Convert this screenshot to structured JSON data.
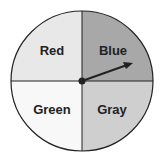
{
  "spinner": {
    "sections": [
      {
        "label": "Red",
        "position": "top-left",
        "fill": "#e8e8e8"
      },
      {
        "label": "Blue",
        "position": "top-right",
        "fill": "#a8a8a8"
      },
      {
        "label": "Green",
        "position": "bottom-left",
        "fill": "#f8f8f8"
      },
      {
        "label": "Gray",
        "position": "bottom-right",
        "fill": "#cfcfcf"
      }
    ],
    "outline_color": "#222222",
    "arrow": {
      "pointing_section": "Blue"
    }
  }
}
